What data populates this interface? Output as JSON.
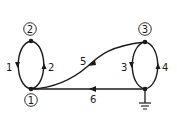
{
  "diagram": {
    "type": "network-graph",
    "nodes": [
      {
        "id": "1",
        "label": "1"
      },
      {
        "id": "2",
        "label": "2"
      },
      {
        "id": "3",
        "label": "3"
      },
      {
        "id": "g",
        "label": "ground"
      }
    ],
    "edges": [
      {
        "id": "1",
        "label": "1",
        "from": "2",
        "to": "1"
      },
      {
        "id": "2",
        "label": "2",
        "from": "1",
        "to": "2"
      },
      {
        "id": "3",
        "label": "3",
        "from": "3",
        "to": "g"
      },
      {
        "id": "4",
        "label": "4",
        "from": "g",
        "to": "3"
      },
      {
        "id": "5",
        "label": "5",
        "from": "3",
        "to": "1"
      },
      {
        "id": "6",
        "label": "6",
        "from": "g",
        "to": "1"
      }
    ],
    "colors": {
      "stroke": "#1a1a1a",
      "background": "#ffffff"
    }
  }
}
